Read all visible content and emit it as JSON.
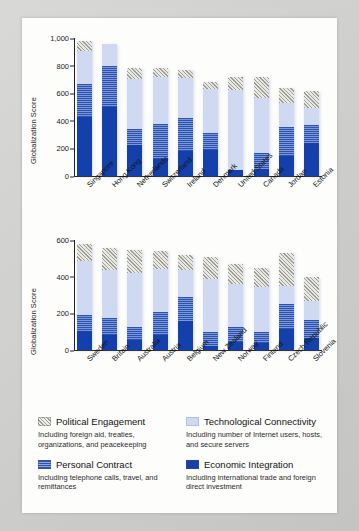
{
  "chart_data": [
    {
      "type": "bar",
      "id": "top",
      "stacked": true,
      "title": "",
      "xlabel": "",
      "ylabel": "Globalization Score",
      "ylim": [
        0,
        1000
      ],
      "yticks": [
        "0",
        "200",
        "400",
        "600",
        "800",
        "1,000"
      ],
      "ytick_values": [
        0,
        200,
        400,
        600,
        800,
        1000
      ],
      "grid": false,
      "legend_position": "below-figure",
      "categories": [
        "Singapore",
        "Hong Kong",
        "Netherlands",
        "Switzerland",
        "Ireland",
        "Denmark",
        "United States",
        "Canada",
        "Jordan",
        "Estonia"
      ],
      "series": [
        {
          "name": "Economic Integration",
          "values": [
            425,
            500,
            225,
            120,
            180,
            190,
            40,
            50,
            145,
            240
          ]
        },
        {
          "name": "Personal Contract",
          "values": [
            240,
            300,
            115,
            255,
            240,
            120,
            5,
            115,
            210,
            130
          ]
        },
        {
          "name": "Technological Connectivity",
          "values": [
            240,
            155,
            360,
            340,
            290,
            320,
            580,
            400,
            175,
            125
          ]
        },
        {
          "name": "Political Engagement",
          "values": [
            70,
            0,
            80,
            65,
            60,
            50,
            95,
            150,
            105,
            120
          ]
        }
      ],
      "totals": [
        975,
        955,
        780,
        780,
        770,
        680,
        720,
        715,
        635,
        615
      ]
    },
    {
      "type": "bar",
      "id": "bottom",
      "stacked": true,
      "title": "",
      "xlabel": "",
      "ylabel": "Globalization Score",
      "ylim": [
        0,
        600
      ],
      "yticks": [
        "0",
        "200",
        "400",
        "600"
      ],
      "ytick_values": [
        0,
        200,
        400,
        600
      ],
      "grid": false,
      "legend_position": "below-figure",
      "categories": [
        "Sweden",
        "Britain",
        "Australia",
        "Austria",
        "Belgium",
        "New Zealand",
        "Norway",
        "Finland",
        "Czech Republic",
        "Slovenia"
      ],
      "series": [
        {
          "name": "Economic Integration",
          "values": [
            103,
            80,
            55,
            80,
            160,
            20,
            45,
            40,
            115,
            65
          ]
        },
        {
          "name": "Personal Contract",
          "values": [
            90,
            95,
            70,
            125,
            130,
            80,
            80,
            60,
            135,
            100
          ]
        },
        {
          "name": "Technological Connectivity",
          "values": [
            290,
            260,
            295,
            235,
            145,
            290,
            235,
            245,
            100,
            105
          ]
        },
        {
          "name": "Political Engagement",
          "values": [
            95,
            120,
            125,
            100,
            85,
            120,
            110,
            105,
            180,
            130
          ]
        }
      ],
      "totals": [
        578,
        555,
        545,
        540,
        520,
        510,
        470,
        450,
        430,
        400
      ]
    }
  ],
  "legend": {
    "items": [
      {
        "key": "political-engagement",
        "label": "Political Engagement",
        "description": "Including foreign aid, treaties, organizations, and peacekeeping",
        "swatch": "hatched-gray",
        "color": "#9d9d96"
      },
      {
        "key": "technological-connectivity",
        "label": "Technological Connectivity",
        "description": "Including number of Internet users, hosts, and secure servers",
        "swatch": "solid-light-blue",
        "color": "#cfd9f1"
      },
      {
        "key": "personal-contract",
        "label": "Personal Contract",
        "description": "Including telephone calls, travel, and remittances",
        "swatch": "striped-blue",
        "color": "#2a53b4"
      },
      {
        "key": "economic-integration",
        "label": "Economic Integration",
        "description": "Including international trade and foreign direct investment",
        "swatch": "solid-dark-blue",
        "color": "#1340ab"
      }
    ]
  }
}
